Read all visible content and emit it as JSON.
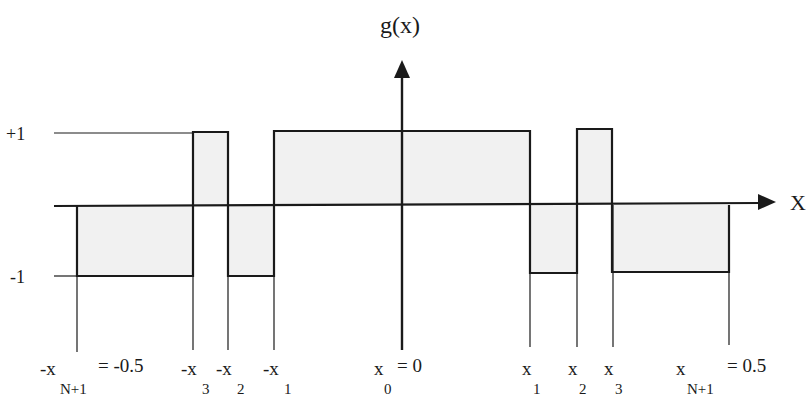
{
  "title": "g(x)",
  "axes": {
    "x_label": "X",
    "y_label": "g(x)"
  },
  "levels": {
    "plus_one": "+1",
    "minus_one": "-1"
  },
  "colors": {
    "stroke": "#1a1a1a",
    "fill": "#f1f1f1",
    "background": "#ffffff"
  },
  "tick_labels": [
    {
      "id": "neg_xN1",
      "prefix": "-x",
      "sub": "N+1",
      "suffix": "= -0.5"
    },
    {
      "id": "neg_x3",
      "prefix": "-x",
      "sub": "3",
      "suffix": ""
    },
    {
      "id": "neg_x2",
      "prefix": "-x",
      "sub": "2",
      "suffix": ""
    },
    {
      "id": "neg_x1",
      "prefix": "-x",
      "sub": "1",
      "suffix": ""
    },
    {
      "id": "x0",
      "prefix": "x",
      "sub": "0",
      "suffix": "= 0"
    },
    {
      "id": "x1",
      "prefix": "x",
      "sub": "1",
      "suffix": ""
    },
    {
      "id": "x2",
      "prefix": "x",
      "sub": "2",
      "suffix": ""
    },
    {
      "id": "x3",
      "prefix": "x",
      "sub": "3",
      "suffix": ""
    },
    {
      "id": "xN1",
      "prefix": "x",
      "sub": "N+1",
      "suffix": "= 0.5"
    }
  ],
  "segments": [
    {
      "from": "-x_{N+1}",
      "to": "-x_3",
      "value": -1
    },
    {
      "from": "-x_3",
      "to": "-x_2",
      "value": 1
    },
    {
      "from": "-x_2",
      "to": "-x_1",
      "value": -1
    },
    {
      "from": "-x_1",
      "to": "x_1",
      "value": 1
    },
    {
      "from": "x_1",
      "to": "x_2",
      "value": -1
    },
    {
      "from": "x_2",
      "to": "x_3",
      "value": 1
    },
    {
      "from": "x_3",
      "to": "x_{N+1}",
      "value": -1
    }
  ]
}
